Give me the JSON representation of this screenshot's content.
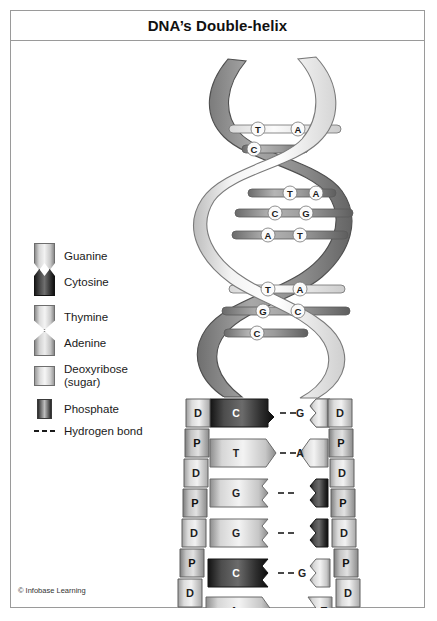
{
  "title": "DNA’s Double-helix",
  "credit": "© Infobase Learning",
  "legend": {
    "items": [
      {
        "key": "guanine",
        "label": "Guanine",
        "swatch": "guanine-swatch",
        "tone": "light"
      },
      {
        "key": "cytosine",
        "label": "Cytosine",
        "swatch": "cytosine-swatch",
        "tone": "dark"
      },
      {
        "key": "thymine",
        "label": "Thymine",
        "swatch": "thymine-swatch",
        "tone": "light"
      },
      {
        "key": "adenine",
        "label": "Adenine",
        "swatch": "adenine-swatch",
        "tone": "light"
      },
      {
        "key": "deoxy",
        "label": "Deoxyribose\n(sugar)",
        "swatch": "deoxyribose-swatch",
        "tone": "light"
      },
      {
        "key": "phosphate",
        "label": "Phosphate",
        "swatch": "phosphate-swatch",
        "tone": "dark"
      },
      {
        "key": "hbond",
        "label": "Hydrogen bond",
        "swatch": "hydrogen-bond-swatch",
        "tone": "line"
      }
    ],
    "deoxyribose_line1": "Deoxyribose",
    "deoxyribose_line2": "(sugar)"
  },
  "backbone": {
    "unit_labels": {
      "sugar": "D",
      "phosphate": "P"
    },
    "left_sequence": [
      "D",
      "P",
      "D",
      "P",
      "D",
      "P",
      "D",
      "P",
      "D",
      "P",
      "D",
      "P"
    ],
    "right_sequence": [
      "D",
      "P",
      "D",
      "P",
      "D",
      "P",
      "D",
      "P",
      "D",
      "P",
      "D",
      "P"
    ]
  },
  "ladder": {
    "rungs": [
      {
        "index": 1,
        "left_base": "C",
        "right_base": "G",
        "left_tone": "dark",
        "right_tone": "light",
        "left_shape": "purine-zigzag",
        "right_shape": "pyrimidine-zigzag"
      },
      {
        "index": 2,
        "left_base": "T",
        "right_base": "A",
        "left_tone": "light",
        "right_tone": "light",
        "left_shape": "notch-v",
        "right_shape": "point-v"
      },
      {
        "index": 3,
        "left_base": "G",
        "right_base": "C",
        "left_tone": "light",
        "right_tone": "dark",
        "left_shape": "purine-zigzag",
        "right_shape": "pyrimidine-zigzag"
      },
      {
        "index": 4,
        "left_base": "G",
        "right_base": "C",
        "left_tone": "light",
        "right_tone": "dark",
        "left_shape": "purine-zigzag",
        "right_shape": "pyrimidine-zigzag"
      },
      {
        "index": 5,
        "left_base": "C",
        "right_base": "G",
        "left_tone": "dark",
        "right_tone": "light",
        "left_shape": "purine-zigzag",
        "right_shape": "pyrimidine-zigzag"
      },
      {
        "index": 6,
        "left_base": "A",
        "right_base": "T",
        "left_tone": "light",
        "right_tone": "light",
        "left_shape": "point-v",
        "right_shape": "notch-v"
      }
    ]
  },
  "helix": {
    "rungs": [
      {
        "index": 1,
        "left_base": "T",
        "right_base": "A"
      },
      {
        "index": 2,
        "left_base": "C",
        "right_base": "G"
      },
      {
        "index": 3,
        "left_base": "T",
        "right_base": "A"
      },
      {
        "index": 4,
        "left_base": "C",
        "right_base": "G"
      },
      {
        "index": 5,
        "left_base": "A",
        "right_base": "T"
      },
      {
        "index": 6,
        "left_base": "T",
        "right_base": "A"
      },
      {
        "index": 7,
        "left_base": "G",
        "right_base": "C"
      },
      {
        "index": 8,
        "left_base": "C",
        "right_base": ""
      }
    ]
  },
  "colors": {
    "frame": "#9a9a9a",
    "light_base": "#e8e8e8",
    "dark_base": "#2b2b2b",
    "backbone_sugar": "#d8d8d8",
    "backbone_phosphate": "#7a7a7a",
    "ribbon_front": "#f2f2f2",
    "ribbon_back": "#8f8f8f",
    "text": "#1a1a1a"
  }
}
